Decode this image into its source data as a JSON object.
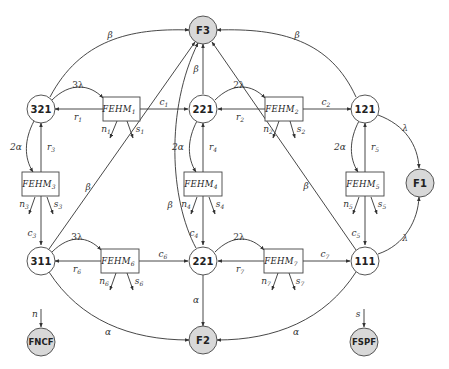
{
  "diagram": {
    "type": "state-transition",
    "nodes": {
      "F3": {
        "label": "F3",
        "kind": "failure",
        "fill": "#d8d8d8"
      },
      "F1": {
        "label": "F1",
        "kind": "failure",
        "fill": "#d8d8d8"
      },
      "F2": {
        "label": "F2",
        "kind": "failure",
        "fill": "#d8d8d8"
      },
      "FNCF": {
        "label": "FNCF",
        "kind": "failure",
        "fill": "#d8d8d8"
      },
      "FSPF": {
        "label": "FSPF",
        "kind": "failure",
        "fill": "#d8d8d8"
      },
      "s321": {
        "label": "321",
        "kind": "state"
      },
      "s221a": {
        "label": "221",
        "kind": "state"
      },
      "s121": {
        "label": "121",
        "kind": "state"
      },
      "s311": {
        "label": "311",
        "kind": "state"
      },
      "s221b": {
        "label": "221",
        "kind": "state"
      },
      "s111": {
        "label": "111",
        "kind": "state"
      }
    },
    "boxes": {
      "FEHM1": {
        "label": "FEHM",
        "sub": "1"
      },
      "FEHM2": {
        "label": "FEHM",
        "sub": "2"
      },
      "FEHM3": {
        "label": "FEHM",
        "sub": "3"
      },
      "FEHM4": {
        "label": "FEHM",
        "sub": "4"
      },
      "FEHM5": {
        "label": "FEHM",
        "sub": "5"
      },
      "FEHM6": {
        "label": "FEHM",
        "sub": "6"
      },
      "FEHM7": {
        "label": "FEHM",
        "sub": "7"
      }
    },
    "edge_labels": {
      "beta_321_F3": "β",
      "beta_121_F3": "β",
      "beta_221a_F3": "β",
      "beta_311_F3": "β",
      "beta_221b_F3": "β",
      "beta_111_F3": "β",
      "lambda3_321": "3λ",
      "lambda2_221a": "2λ",
      "lambda3_311": "3λ",
      "lambda2_221b": "2λ",
      "lambda_121_F1": "λ",
      "lambda_111_F1": "λ",
      "alpha2_321": "2α",
      "alpha2_221a": "2α",
      "alpha2_121": "2α",
      "alpha_221b_F2": "α",
      "alpha_311_F2": "α",
      "alpha_111_F2": "α",
      "r1": "r",
      "r1_sub": "1",
      "r2": "r",
      "r2_sub": "2",
      "r3": "r",
      "r3_sub": "3",
      "r4": "r",
      "r4_sub": "4",
      "r5": "r",
      "r5_sub": "5",
      "r6": "r",
      "r6_sub": "6",
      "r7": "r",
      "r7_sub": "7",
      "c1": "c",
      "c1_sub": "1",
      "c2": "c",
      "c2_sub": "2",
      "c3": "c",
      "c3_sub": "3",
      "c4": "c",
      "c4_sub": "4",
      "c5": "c",
      "c5_sub": "5",
      "c6": "c",
      "c6_sub": "6",
      "c7": "c",
      "c7_sub": "7",
      "n1": "n",
      "n1_sub": "1",
      "s1": "s",
      "s1_sub": "1",
      "n2": "n",
      "n2_sub": "2",
      "s2": "s",
      "s2_sub": "2",
      "n3": "n",
      "n3_sub": "3",
      "s3": "s",
      "s3_sub": "3",
      "n4": "n",
      "n4_sub": "4",
      "s4": "s",
      "s4_sub": "4",
      "n5": "n",
      "n5_sub": "5",
      "s5": "s",
      "s5_sub": "5",
      "n6": "n",
      "n6_sub": "6",
      "s6": "s",
      "s6_sub": "6",
      "n7": "n",
      "n7_sub": "7",
      "s7": "s",
      "s7_sub": "7",
      "n_FNCF": "n",
      "s_FSPF": "s"
    }
  }
}
